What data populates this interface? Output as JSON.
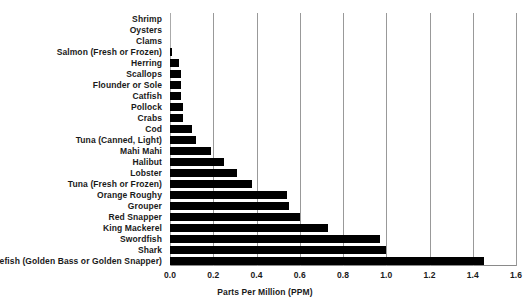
{
  "chart_data": {
    "type": "bar",
    "orientation": "horizontal",
    "title": "",
    "xlabel": "Parts Per Million (PPM)",
    "ylabel": "",
    "xlim": [
      0.0,
      1.6
    ],
    "xticks": [
      "0.0",
      "0.2",
      "0.4",
      "0.6",
      "0.8",
      "1.0",
      "1.2",
      "1.4",
      "1.6"
    ],
    "xtick_values": [
      0.0,
      0.2,
      0.4,
      0.6,
      0.8,
      1.0,
      1.2,
      1.4,
      1.6
    ],
    "grid": "vertical",
    "legend": "none",
    "bar_color": "#000000",
    "categories": [
      "Shrimp",
      "Oysters",
      "Clams",
      "Salmon (Fresh or Frozen)",
      "Herring",
      "Scallops",
      "Flounder or Sole",
      "Catfish",
      "Pollock",
      "Crabs",
      "Cod",
      "Tuna (Canned, Light)",
      "Mahi Mahi",
      "Halibut",
      "Lobster",
      "Tuna (Fresh or Frozen)",
      "Orange Roughy",
      "Grouper",
      "Red Snapper",
      "King Mackerel",
      "Swordfish",
      "Shark",
      "Tilefish (Golden Bass or Golden Snapper)"
    ],
    "values": [
      0.0,
      0.0,
      0.0,
      0.01,
      0.04,
      0.05,
      0.05,
      0.05,
      0.06,
      0.06,
      0.1,
      0.12,
      0.19,
      0.25,
      0.31,
      0.38,
      0.54,
      0.55,
      0.6,
      0.73,
      0.97,
      1.0,
      1.45
    ]
  }
}
